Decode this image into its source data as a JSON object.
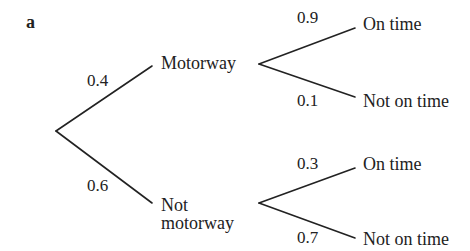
{
  "part_label": "a",
  "tree": {
    "root": {
      "branches": [
        {
          "probability": "0.4",
          "label": "Motorway",
          "children": [
            {
              "probability": "0.9",
              "label": "On time"
            },
            {
              "probability": "0.1",
              "label": "Not on time"
            }
          ]
        },
        {
          "probability": "0.6",
          "label_line1": "Not",
          "label_line2": "motorway",
          "children": [
            {
              "probability": "0.3",
              "label": "On time"
            },
            {
              "probability": "0.7",
              "label": "Not on time"
            }
          ]
        }
      ]
    }
  },
  "colors": {
    "line": "#222222",
    "text": "#222222",
    "background": "#ffffff"
  }
}
